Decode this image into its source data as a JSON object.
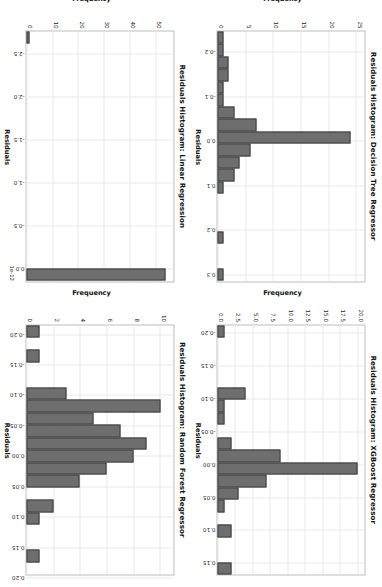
{
  "figure": {
    "background": "#ffffff",
    "bar_fill": "#6e6e6e",
    "bar_edge": "#3f3f3f",
    "grid_color": "#e9e9e9",
    "orientation_note": "rotated"
  },
  "charts": [
    {
      "id": "decision-tree",
      "chart_data": {
        "type": "bar",
        "title": "Residuals Histogram: Decision Tree Regressor",
        "xlabel": "Residuals",
        "ylabel": "Frequency",
        "xlim": [
          -0.245,
          0.315
        ],
        "ylim": [
          0,
          26.5
        ],
        "xticks": [
          "-0.2",
          "-0.1",
          "0.0",
          "0.1",
          "0.2",
          "0.3"
        ],
        "xtick_values": [
          -0.2,
          -0.1,
          0.0,
          0.1,
          0.2,
          0.3
        ],
        "yticks": [
          "0",
          "5",
          "10",
          "15",
          "20",
          "25"
        ],
        "ytick_values": [
          0,
          5,
          10,
          15,
          20,
          25
        ],
        "grid": true,
        "legend": "none",
        "bin_edges": [
          -0.245,
          -0.217,
          -0.189,
          -0.161,
          -0.133,
          -0.105,
          -0.077,
          -0.049,
          -0.021,
          0.007,
          0.035,
          0.063,
          0.091,
          0.119,
          0.147,
          0.175,
          0.203,
          0.231,
          0.259,
          0.287,
          0.315
        ],
        "values": [
          1,
          1,
          2,
          2,
          1,
          1,
          3,
          7,
          24,
          6,
          4,
          3,
          1,
          0,
          0,
          0,
          1,
          0,
          0,
          1
        ]
      }
    },
    {
      "id": "xgboost",
      "chart_data": {
        "type": "bar",
        "title": "Residuals Histogram: XGBoost Regressor",
        "xlabel": "Residuals",
        "ylabel": "Frequency",
        "xlim": [
          -0.212,
          0.168
        ],
        "ylim": [
          0,
          21.0
        ],
        "xticks": [
          "-0.20",
          "-0.15",
          "-0.10",
          "-0.05",
          "0.00",
          "0.05",
          "0.10",
          "0.15"
        ],
        "xtick_values": [
          -0.2,
          -0.15,
          -0.1,
          -0.05,
          0.0,
          0.05,
          0.1,
          0.15
        ],
        "yticks": [
          "0.0",
          "2.5",
          "5.0",
          "7.5",
          "10.0",
          "12.5",
          "15.0",
          "17.5",
          "20.0"
        ],
        "ytick_values": [
          0.0,
          2.5,
          5.0,
          7.5,
          10.0,
          12.5,
          15.0,
          17.5,
          20.0
        ],
        "grid": true,
        "legend": "none",
        "bin_edges": [
          -0.212,
          -0.193,
          -0.174,
          -0.155,
          -0.136,
          -0.117,
          -0.098,
          -0.079,
          -0.06,
          -0.041,
          -0.022,
          -0.003,
          0.016,
          0.035,
          0.054,
          0.073,
          0.092,
          0.111,
          0.13,
          0.149,
          0.168
        ],
        "values": [
          1,
          0,
          0,
          0,
          0,
          4,
          1,
          1,
          0,
          2,
          9,
          20,
          7,
          3,
          1,
          0,
          2,
          0,
          0,
          2
        ]
      }
    },
    {
      "id": "linear-regression",
      "chart_data": {
        "type": "bar",
        "title": "Residuals Histogram: Linear Regression",
        "xlabel": "Residuals",
        "ylabel": "Frequency",
        "x_offset_text": "1e-12",
        "xlim": [
          -2.75,
          0.15
        ],
        "ylim": [
          0,
          57
        ],
        "xticks": [
          "-2.5",
          "-2.0",
          "-1.5",
          "-1.0",
          "-0.5",
          "0.0"
        ],
        "xtick_values": [
          -2.5,
          -2.0,
          -1.5,
          -1.0,
          -0.5,
          0.0
        ],
        "yticks": [
          "0",
          "10",
          "20",
          "30",
          "40",
          "50"
        ],
        "ytick_values": [
          0,
          10,
          20,
          30,
          40,
          50
        ],
        "grid": true,
        "legend": "none",
        "bin_edges": [
          -2.75,
          -2.605,
          -2.46,
          -2.315,
          -2.17,
          -2.025,
          -1.88,
          -1.735,
          -1.59,
          -1.445,
          -1.3,
          -1.155,
          -1.01,
          -0.865,
          -0.72,
          -0.575,
          -0.43,
          -0.285,
          -0.14,
          0.005,
          0.15
        ],
        "values": [
          1,
          0,
          0,
          0,
          0,
          0,
          0,
          0,
          0,
          0,
          0,
          0,
          0,
          0,
          0,
          0,
          0,
          0,
          0,
          54
        ]
      }
    },
    {
      "id": "random-forest",
      "chart_data": {
        "type": "bar",
        "title": "Residuals Histogram: Random Forest Regressor",
        "xlabel": "Residuals",
        "ylabel": "Frequency",
        "xlim": [
          -0.215,
          0.195
        ],
        "ylim": [
          0,
          11.0
        ],
        "xticks": [
          "-0.20",
          "-0.15",
          "-0.10",
          "-0.05",
          "0.00",
          "0.05",
          "0.10",
          "0.15",
          "0.20"
        ],
        "xtick_values": [
          -0.2,
          -0.15,
          -0.1,
          -0.05,
          0.0,
          0.05,
          0.1,
          0.15,
          0.2
        ],
        "yticks": [
          "0",
          "2",
          "4",
          "6",
          "8",
          "10"
        ],
        "ytick_values": [
          0,
          2,
          4,
          6,
          8,
          10
        ],
        "grid": true,
        "legend": "none",
        "bin_edges": [
          -0.215,
          -0.1945,
          -0.174,
          -0.1535,
          -0.133,
          -0.1125,
          -0.092,
          -0.0715,
          -0.051,
          -0.0305,
          -0.01,
          0.0105,
          0.031,
          0.0515,
          0.072,
          0.0925,
          0.113,
          0.1335,
          0.154,
          0.1745,
          0.195
        ],
        "values": [
          1,
          0,
          1,
          0,
          0,
          3,
          10,
          5,
          7,
          9,
          8,
          6,
          4,
          0,
          2,
          1,
          0,
          0,
          1,
          0
        ]
      }
    }
  ]
}
